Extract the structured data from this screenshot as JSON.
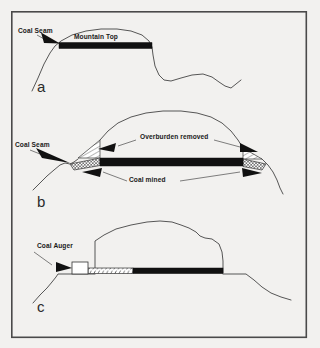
{
  "figure": {
    "background_color": "#f2f1ef",
    "line_color": "#3a3a3a",
    "seam_color": "#111111",
    "frame": {
      "x": 11,
      "y": 11,
      "width": 296,
      "height": 327
    }
  },
  "panels": [
    {
      "id": "a",
      "letter": "a",
      "caption": "Undisturbed mountain with coal seam near the top",
      "labels": [
        {
          "name": "coal-seam",
          "text": "Coal Seam",
          "x": 18,
          "y": 33
        },
        {
          "name": "mountain-top",
          "text": "Mountain Top",
          "x": 74,
          "y": 39
        }
      ]
    },
    {
      "id": "b",
      "letter": "b",
      "caption": "Mountaintop removal: overburden removed and coal mined from both sides",
      "labels": [
        {
          "name": "coal-seam",
          "text": "Coal Seam",
          "x": 15,
          "y": 147
        },
        {
          "name": "overburden-removed",
          "text": "Overburden removed",
          "x": 140,
          "y": 139
        },
        {
          "name": "coal-mined",
          "text": "Coal mined",
          "x": 129,
          "y": 182
        }
      ]
    },
    {
      "id": "c",
      "letter": "c",
      "caption": "Auger mining: coal auger bores horizontally into the exposed seam",
      "labels": [
        {
          "name": "coal-auger",
          "text": "Coal Auger",
          "x": 37,
          "y": 248
        }
      ]
    }
  ],
  "legend_colors": {
    "coal_seam_fill": "#111111",
    "overburden_hatch": "#333333",
    "mined_area_hatch": "#333333",
    "background": "#f2f1ef"
  }
}
